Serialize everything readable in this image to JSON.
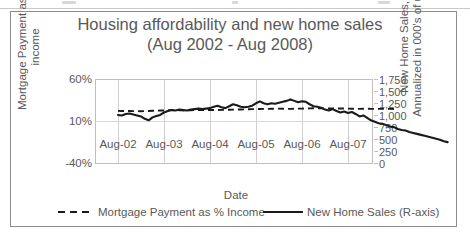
{
  "chart_data": {
    "type": "line",
    "title": "Housing affordability and new home sales",
    "subtitle": "(Aug 2002 - Aug 2008)",
    "xlabel": "Date",
    "left_axis_label": "Mortgage Payment as % income",
    "right_axis_label": "New Home Sales,  Annualized in 000's of units",
    "grid": true,
    "legend_position": "bottom",
    "x_tick_labels": [
      "Aug-02",
      "Aug-03",
      "Aug-04",
      "Aug-05",
      "Aug-06",
      "Aug-07"
    ],
    "left_ylim": [
      -40,
      60
    ],
    "left_tick_labels": [
      "60%",
      "10%",
      "-40%"
    ],
    "left_tick_values": [
      60,
      10,
      -40
    ],
    "right_ylim": [
      0,
      1750
    ],
    "right_tick_labels": [
      "1,750",
      "1,500",
      "1,250",
      "1,000",
      "750",
      "500",
      "250",
      "0"
    ],
    "right_tick_values": [
      1750,
      1500,
      1250,
      1000,
      750,
      500,
      250,
      0
    ],
    "series": [
      {
        "name": "Mortgage Payment as % Income",
        "axis": "left",
        "style": "dashed",
        "color": "#1a1a1a",
        "unit": "%",
        "values": [
          22.5,
          22.4,
          22.3,
          22.3,
          22.2,
          22.2,
          22.1,
          22.2,
          22.4,
          22.6,
          22.8,
          22.9,
          23.0,
          23.2,
          23.4,
          23.4,
          23.3,
          23.2,
          23.2,
          23.3,
          23.4,
          23.5,
          23.6,
          23.6,
          23.5,
          23.5,
          23.6,
          23.7,
          23.8,
          23.9,
          24.0,
          24.1,
          24.2,
          24.3,
          24.4,
          24.5,
          24.6,
          24.7,
          24.8,
          24.9,
          25.0,
          25.1,
          25.1,
          25.0,
          24.9,
          24.9,
          25.0,
          25.1,
          25.2,
          25.3,
          25.4,
          25.5,
          25.5,
          25.4,
          25.3,
          25.3,
          25.4,
          25.4,
          25.3,
          25.2,
          25.1,
          25.0,
          24.9,
          24.9,
          25.0,
          25.0,
          24.9,
          24.8,
          24.8,
          24.9,
          24.9,
          24.8,
          24.7
        ]
      },
      {
        "name": "New Home Sales (R-axis)",
        "axis": "right",
        "style": "solid",
        "color": "#1a1a1a",
        "unit": "thousands of units, annualized",
        "values": [
          1010,
          1000,
          1030,
          1040,
          1020,
          1000,
          980,
          930,
          900,
          960,
          990,
          1010,
          1060,
          1090,
          1110,
          1100,
          1120,
          1110,
          1100,
          1120,
          1130,
          1140,
          1130,
          1140,
          1150,
          1180,
          1200,
          1170,
          1150,
          1190,
          1230,
          1210,
          1180,
          1170,
          1180,
          1200,
          1250,
          1290,
          1250,
          1230,
          1250,
          1240,
          1260,
          1280,
          1300,
          1330,
          1300,
          1270,
          1290,
          1280,
          1230,
          1190,
          1180,
          1160,
          1120,
          1100,
          1130,
          1090,
          1060,
          1080,
          1050,
          1070,
          1030,
          980,
          1000,
          950,
          900,
          870,
          840,
          830,
          800,
          770,
          760,
          720,
          700,
          690,
          660,
          640,
          620,
          600,
          580,
          560,
          540,
          520,
          500,
          470,
          450
        ]
      }
    ]
  },
  "legend": {
    "items": [
      {
        "label": "Mortgage Payment as % Income",
        "marker": "dashed-line"
      },
      {
        "label": "New Home Sales (R-axis)",
        "marker": "solid-line"
      }
    ]
  }
}
